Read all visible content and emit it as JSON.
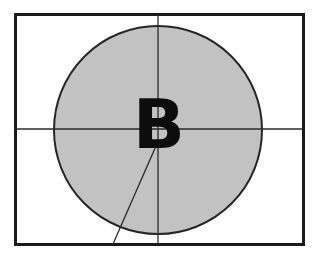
{
  "figure": {
    "background_color": "#ffffff",
    "frame": {
      "name": "outer-rectangle-frame",
      "x": 15,
      "y": 14,
      "width": 288,
      "height": 230,
      "stroke_color": "#1a1a1a",
      "stroke_width": 3,
      "fill": "none"
    },
    "circle": {
      "name": "shaded-circle",
      "center_x": 158,
      "center_y": 130,
      "radius": 104,
      "fill_color": "#c2c2c2",
      "stroke_color": "#262626",
      "stroke_width": 2
    },
    "axes": [
      {
        "name": "horizontal-axis-line",
        "orientation": "horizontal",
        "x1": 15,
        "y1": 129,
        "x2": 303,
        "y2": 129,
        "stroke_color": "#2b2b2b",
        "stroke_width": 1.3
      },
      {
        "name": "vertical-axis-line",
        "orientation": "vertical",
        "x1": 158,
        "y1": 14,
        "x2": 158,
        "y2": 244,
        "stroke_color": "#2b2b2b",
        "stroke_width": 1.3
      }
    ],
    "radial_line": {
      "name": "radial-diagonal-line",
      "x1": 156,
      "y1": 146,
      "x2": 113,
      "y2": 244,
      "stroke_color": "#2b2b2b",
      "stroke_width": 1.3
    },
    "label": {
      "name": "letter-b-label",
      "text": "B",
      "x": 158,
      "y": 148,
      "color": "#0d0d0d",
      "font_size": 68,
      "font_weight": "bold",
      "anchor": "middle-baseline"
    }
  }
}
